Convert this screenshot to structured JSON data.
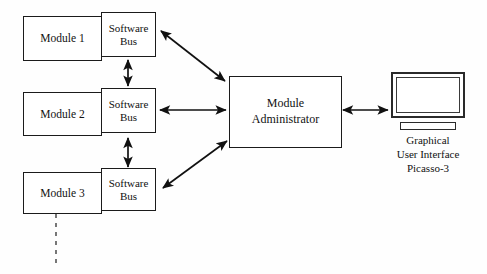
{
  "diagram": {
    "background_color": "#fefefe",
    "line_color": "#111111",
    "modules": [
      {
        "label": "Module 1"
      },
      {
        "label": "Module 2"
      },
      {
        "label": "Module 3"
      }
    ],
    "buses": [
      {
        "line1": "Software",
        "line2": "Bus"
      },
      {
        "line1": "Software",
        "line2": "Bus"
      },
      {
        "line1": "Software",
        "line2": "Bus"
      }
    ],
    "administrator": {
      "line1": "Module",
      "line2": "Administrator"
    },
    "gui": {
      "caption_line1": "Graphical",
      "caption_line2": "User Interface",
      "caption_line3": "Picasso-3",
      "icon": "monitor-icon"
    },
    "connectors": [
      {
        "name": "bus1-bus2-link",
        "style": "double-arrow-vertical"
      },
      {
        "name": "bus2-bus3-link",
        "style": "double-arrow-vertical"
      },
      {
        "name": "bus1-admin-link",
        "style": "double-arrow-diagonal"
      },
      {
        "name": "bus2-admin-link",
        "style": "double-arrow-horizontal"
      },
      {
        "name": "bus3-admin-link",
        "style": "double-arrow-diagonal"
      },
      {
        "name": "admin-gui-link",
        "style": "double-arrow-horizontal"
      },
      {
        "name": "module3-continuation",
        "style": "dashed-line"
      }
    ]
  }
}
